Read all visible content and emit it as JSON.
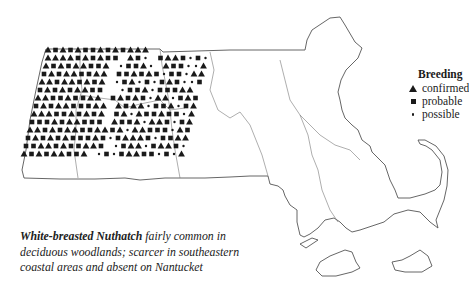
{
  "legend": {
    "title": "Breeding",
    "items": [
      {
        "symbol": "triangle",
        "label": "confirmed"
      },
      {
        "symbol": "square",
        "label": "probable"
      },
      {
        "symbol": "dot",
        "label": "possible"
      }
    ]
  },
  "caption": {
    "species": "White-breasted Nuthatch",
    "text": " fairly common in deciduous woodlands; scarcer in southeastern coastal areas and absent on Nantucket"
  },
  "colors": {
    "ink": "#1a1a1a",
    "outline": "#555555",
    "background": "#ffffff"
  },
  "map": {
    "region": "Massachusetts",
    "symbol_key": {
      "t": "confirmed",
      "s": "probable",
      "d": "possible"
    },
    "grid": {
      "x0": 48,
      "y0": 50,
      "dx": 7.5,
      "dy": 8
    },
    "rows": [
      {
        "y": 50,
        "x0": 48,
        "cells": "tststsstststtt......."
      },
      {
        "y": 58,
        "x0": 48,
        "cells": "ttttststss.tsd.sttsdsd"
      },
      {
        "y": 66,
        "x0": 46,
        "cells": "tststtsst.dsstd.tssddt"
      },
      {
        "y": 74,
        "x0": 44,
        "cells": "ststtsstt.sststsdssdtt"
      },
      {
        "y": 82,
        "x0": 42,
        "cells": "ttsttstst.dstdsdstsdds"
      },
      {
        "y": 90,
        "x0": 40,
        "cells": "stststtss..dsstdssstt."
      },
      {
        "y": 98,
        "x0": 38,
        "cells": "ttsstsstt.ststsdttdsts"
      },
      {
        "y": 106,
        "x0": 36,
        "cells": "ststtssstt.tsttdsstdst"
      },
      {
        "y": 114,
        "x0": 34,
        "cells": "tttsststst.stdtsstssdt"
      },
      {
        "y": 122,
        "x0": 32,
        "cells": "ssststtsss.tsstdttsdst"
      },
      {
        "y": 130,
        "x0": 30,
        "cells": "ttststtssttstdttsssdts"
      },
      {
        "y": 138,
        "x0": 28,
        "cells": "stststssstsdstttsdsstt"
      },
      {
        "y": 146,
        "x0": 26,
        "cells": "ssttstsstts.dsttdsttsd"
      },
      {
        "y": 154,
        "x0": 24,
        "cells": "tststtsst.dsdsttssdsdt"
      }
    ]
  }
}
